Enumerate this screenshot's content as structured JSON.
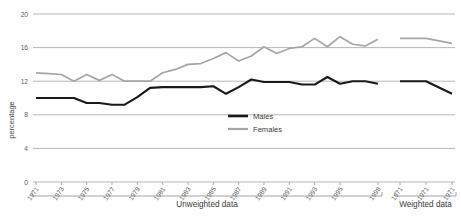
{
  "chart_data": {
    "type": "line",
    "title": "",
    "xlabel": "",
    "ylabel": "percentage",
    "ylim": [
      0,
      20
    ],
    "yticks": [
      0,
      4,
      8,
      12,
      16,
      20
    ],
    "grid": true,
    "legend_position": "center-bottom-inside",
    "x": [
      "1971",
      "1972",
      "1973",
      "1974",
      "1975",
      "1976",
      "1977",
      "1978",
      "1979",
      "1980",
      "1981",
      "1982",
      "1983",
      "1984",
      "1985",
      "1986",
      "1987",
      "1988",
      "1989",
      "1990",
      "1991",
      "1992",
      "1993",
      "1994",
      "1995",
      "1996",
      "1997",
      "1998",
      "1971w",
      "1972w",
      "1973w"
    ],
    "xtick_labels": [
      "1971",
      "1973",
      "1975",
      "1977",
      "1979",
      "1981",
      "1983",
      "1985",
      "1987",
      "1989",
      "1991",
      "1993",
      "1995",
      "1998",
      "1971",
      "1971",
      "1971"
    ],
    "groups": [
      {
        "label": "Unweighted data",
        "from": "1971",
        "to": "1998"
      },
      {
        "label": "Weighted data",
        "from": "1971w",
        "to": "1973w"
      }
    ],
    "series": [
      {
        "name": "Males",
        "color": "#1a1a1a",
        "values": [
          10.0,
          10.0,
          10.0,
          10.0,
          9.4,
          9.4,
          9.2,
          9.2,
          10.1,
          11.2,
          11.3,
          11.3,
          11.3,
          11.3,
          11.4,
          10.5,
          11.3,
          12.2,
          11.9,
          11.9,
          11.9,
          11.6,
          11.6,
          12.5,
          11.7,
          12.0,
          12.0,
          11.7,
          12.0,
          12.0,
          10.5
        ]
      },
      {
        "name": "Females",
        "color": "#a6a6a6",
        "values": [
          13.0,
          12.9,
          12.8,
          12.0,
          12.8,
          12.1,
          12.8,
          12.0,
          12.0,
          12.0,
          13.0,
          13.4,
          14.0,
          14.1,
          14.7,
          15.4,
          14.4,
          15.0,
          16.1,
          15.3,
          15.9,
          16.1,
          17.1,
          16.1,
          17.3,
          16.4,
          16.2,
          17.0,
          17.1,
          17.1,
          16.5
        ]
      }
    ]
  },
  "legend": {
    "males_label": "Males",
    "females_label": "Females"
  },
  "axis": {
    "y_title": "percentage"
  }
}
